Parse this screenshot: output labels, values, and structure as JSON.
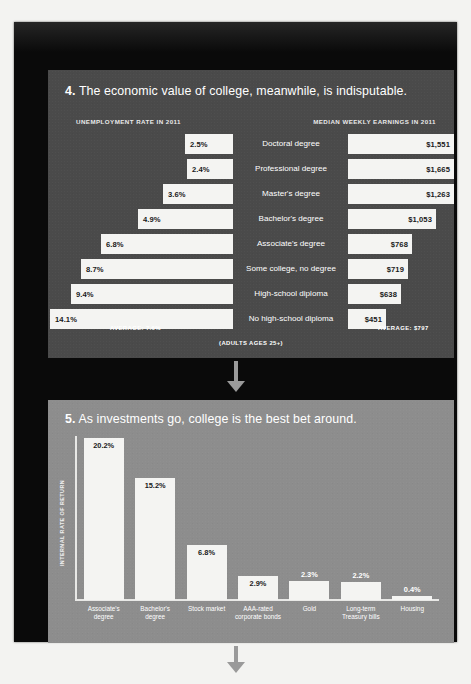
{
  "panel4": {
    "number": "4.",
    "headline": "The economic value of college, meanwhile, is indisputable.",
    "left_column_header": "UNEMPLOYMENT RATE IN 2011",
    "right_column_header": "MEDIAN WEEKLY EARNINGS IN 2011",
    "average_left": "AVERAGE: 7.6%",
    "average_right": "AVERAGE: $797",
    "footnote": "(ADULTS AGES 25+)"
  },
  "panel5": {
    "number": "5.",
    "headline": "As investments go, college is the best bet around.",
    "y_axis_label": "INTERNAL RATE OF RETURN"
  },
  "chart_data": [
    {
      "type": "bar",
      "orientation": "horizontal-paired",
      "title": "The economic value of college, meanwhile, is indisputable.",
      "categories": [
        "Doctoral degree",
        "Professional degree",
        "Master's degree",
        "Bachelor's degree",
        "Associate's degree",
        "Some college, no degree",
        "High-school diploma",
        "No high-school diploma"
      ],
      "series": [
        {
          "name": "Unemployment rate in 2011",
          "unit": "%",
          "labels": [
            "2.5%",
            "2.4%",
            "3.6%",
            "4.9%",
            "6.8%",
            "8.7%",
            "9.4%",
            "14.1%"
          ],
          "values": [
            2.5,
            2.4,
            3.6,
            4.9,
            6.8,
            8.7,
            9.4,
            14.1
          ],
          "average": 7.6,
          "average_label": "AVERAGE: 7.6%"
        },
        {
          "name": "Median weekly earnings in 2011",
          "unit": "$",
          "labels": [
            "$1,551",
            "$1,665",
            "$1,263",
            "$1,053",
            "$768",
            "$719",
            "$638",
            "$451"
          ],
          "values": [
            1551,
            1665,
            1263,
            1053,
            768,
            719,
            638,
            451
          ],
          "average": 797,
          "average_label": "AVERAGE: $797"
        }
      ],
      "note": "(ADULTS AGES 25+)",
      "grid": false,
      "legend": "none"
    },
    {
      "type": "bar",
      "orientation": "vertical",
      "title": "As investments go, college is the best bet around.",
      "ylabel": "INTERNAL RATE OF RETURN",
      "xlabel": "",
      "categories": [
        "Associate's degree",
        "Bachelor's degree",
        "Stock market",
        "AAA-rated corporate bonds",
        "Gold",
        "Long-term Treasury bills",
        "Housing"
      ],
      "values": [
        20.2,
        15.2,
        6.8,
        2.9,
        2.3,
        2.2,
        0.4
      ],
      "labels": [
        "20.2%",
        "15.2%",
        "6.8%",
        "2.9%",
        "2.3%",
        "2.2%",
        "0.4%"
      ],
      "ylim": [
        0,
        22
      ],
      "grid": false,
      "legend": "none"
    }
  ],
  "rows4": [
    {
      "label": "Doctoral degree",
      "left": "2.5%",
      "left_w": 48,
      "right": "$1,551",
      "right_w": 130
    },
    {
      "label": "Professional degree",
      "left": "2.4%",
      "left_w": 46,
      "right": "$1,665",
      "right_w": 140
    },
    {
      "label": "Master's degree",
      "left": "3.6%",
      "left_w": 70,
      "right": "$1,263",
      "right_w": 106
    },
    {
      "label": "Bachelor's degree",
      "left": "4.9%",
      "left_w": 95,
      "right": "$1,053",
      "right_w": 88
    },
    {
      "label": "Associate's degree",
      "left": "6.8%",
      "left_w": 132,
      "right": "$768",
      "right_w": 64
    },
    {
      "label": "Some college, no degree",
      "left": "8.7%",
      "left_w": 152,
      "right": "$719",
      "right_w": 60
    },
    {
      "label": "High-school diploma",
      "left": "9.4%",
      "left_w": 162,
      "right": "$638",
      "right_w": 53
    },
    {
      "label": "No high-school diploma",
      "left": "14.1%",
      "left_w": 183,
      "right": "$451",
      "right_w": 38
    }
  ],
  "bars5": [
    {
      "cat": "Associate's degree",
      "label": "20.2%",
      "h": 162,
      "inside": true
    },
    {
      "cat": "Bachelor's degree",
      "label": "15.2%",
      "h": 122,
      "inside": true
    },
    {
      "cat": "Stock market",
      "label": "6.8%",
      "h": 55,
      "inside": true
    },
    {
      "cat": "AAA-rated corporate bonds",
      "label": "2.9%",
      "h": 24,
      "inside": true
    },
    {
      "cat": "Gold",
      "label": "2.3%",
      "h": 19,
      "inside": false
    },
    {
      "cat": "Long-term Treasury bills",
      "label": "2.2%",
      "h": 18,
      "inside": false
    },
    {
      "cat": "Housing",
      "label": "0.4%",
      "h": 4,
      "inside": false
    }
  ]
}
